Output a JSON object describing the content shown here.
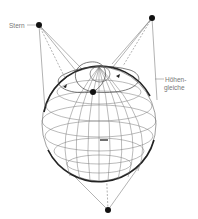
{
  "diagram": {
    "labels": {
      "star": "Stern",
      "circle_line1": "Höhen-",
      "circle_line2": "gleiche"
    },
    "colors": {
      "line": "#555555",
      "outline": "#222222",
      "dot": "#111111",
      "label": "#777777"
    },
    "stars": [
      {
        "name": "star-top-left",
        "x": 39,
        "y": 25
      },
      {
        "name": "star-top-right",
        "x": 152,
        "y": 18
      },
      {
        "name": "star-bottom",
        "x": 108,
        "y": 210
      }
    ],
    "globe": {
      "cx": 99,
      "cy": 124,
      "r": 57
    }
  }
}
